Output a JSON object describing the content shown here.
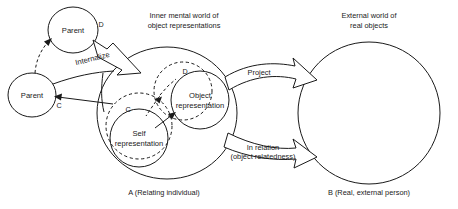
{
  "diagram": {
    "title_inner_world_line1": "Inner mental world of",
    "title_inner_world_line2": "object representations",
    "title_external_world_line1": "External world of",
    "title_external_world_line2": "real objects",
    "caption_left": "A (Relating individual)",
    "caption_right": "B (Real, external person)",
    "nodes": {
      "parent_top": "Parent",
      "parent_left": "Parent",
      "self_rep_line1": "Self",
      "self_rep_line2": "representation",
      "object_rep_line1": "Object",
      "object_rep_line2": "representation"
    },
    "letters": {
      "parent_top_letter": "D",
      "parent_left_letter": "C",
      "self_rep_letter": "C",
      "object_rep_letter": "D"
    },
    "arrows": {
      "internalize": "Internalize",
      "project": "Project",
      "in_relation_line1": "In relation",
      "in_relation_line2": "(object relatedness)"
    },
    "colors": {
      "stroke": "#1a1a1a",
      "background": "#ffffff"
    }
  }
}
